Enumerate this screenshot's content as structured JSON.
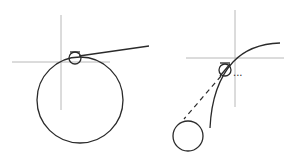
{
  "diagram": {
    "left_figure": {
      "crosshair": {
        "x": 61,
        "y": 62
      },
      "big_circle": {
        "cx": 80,
        "cy": 101,
        "r": 43
      },
      "small_circle": {
        "cx": 74,
        "cy": 58,
        "r": 6
      },
      "tangent_line": {
        "x1": 78,
        "y1": 56,
        "x2": 149,
        "y2": 46
      }
    },
    "right_figure": {
      "crosshair": {
        "x": 235,
        "y": 58
      },
      "small_circle": {
        "cx": 225,
        "cy": 70,
        "r": 6
      },
      "bottom_circle": {
        "cx": 188,
        "cy": 136,
        "r": 15
      },
      "ellipsis": "..."
    },
    "colors": {
      "stroke": "#2a2a2a",
      "axis": "#b8b8b8",
      "background": "#ffffff"
    }
  }
}
